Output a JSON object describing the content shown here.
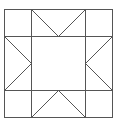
{
  "diagram": {
    "type": "quilt-block",
    "name": "Sawtooth star block",
    "stroke_color": "#555555",
    "background": "#ffffff",
    "grid": {
      "cols": 3,
      "rows": 3
    },
    "outer": {
      "x": 4,
      "y": 9,
      "w": 108,
      "h": 108
    },
    "lines": {
      "v1": 31,
      "v2": 85,
      "h1": 36,
      "h2": 90
    }
  }
}
